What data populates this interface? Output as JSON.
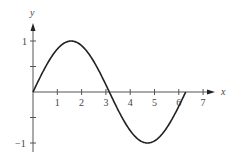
{
  "chart_data": {
    "type": "line",
    "title": "",
    "xlabel": "x",
    "ylabel": "y",
    "function": "sin(x)",
    "x_range": [
      0,
      6.283
    ],
    "xlim": [
      0,
      7
    ],
    "ylim": [
      -1,
      1
    ],
    "x_ticks": [
      1,
      2,
      3,
      4,
      5,
      6,
      7
    ],
    "x_tick_labels": [
      "1",
      "2",
      "3",
      "4",
      "5",
      "6",
      "7"
    ],
    "y_ticks": [
      -1,
      -0.5,
      0.5,
      1
    ],
    "y_tick_labels": [
      "−1",
      "",
      "",
      "1"
    ],
    "grid": false,
    "legend": false,
    "series": [
      {
        "name": "y = sin x",
        "x": [
          0,
          0.785,
          1.571,
          2.356,
          3.142,
          3.927,
          4.712,
          5.498,
          6.283
        ],
        "values": [
          0,
          0.707,
          1,
          0.707,
          0,
          -0.707,
          -1,
          -0.707,
          0
        ]
      }
    ],
    "colors": {
      "axis": "#555555",
      "curve": "#222222"
    }
  }
}
